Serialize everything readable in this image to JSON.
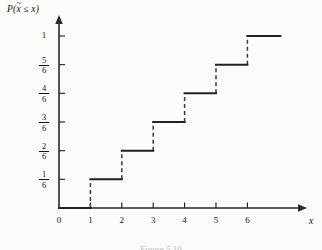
{
  "figure": {
    "y_axis_title": "P(",
    "y_axis_title_var": "x",
    "y_axis_title_rest": " ≤ x)",
    "x_axis_title": "x",
    "caption": "Figure 5.10"
  },
  "chart_data": {
    "type": "line",
    "subtype": "step-cdf",
    "title": "",
    "xlabel": "x",
    "ylabel": "P(x̃ ≤ x)",
    "xlim": [
      0,
      7.2
    ],
    "ylim": [
      0,
      1.08
    ],
    "grid": false,
    "legend": null,
    "x_ticks": [
      {
        "value": 0,
        "label": "0"
      },
      {
        "value": 1,
        "label": "1"
      },
      {
        "value": 2,
        "label": "2"
      },
      {
        "value": 3,
        "label": "3"
      },
      {
        "value": 4,
        "label": "4"
      },
      {
        "value": 5,
        "label": "5"
      },
      {
        "value": 6,
        "label": "6"
      }
    ],
    "y_ticks": [
      {
        "value": 0.166667,
        "label": "1/6",
        "numerator": "1",
        "denominator": "6"
      },
      {
        "value": 0.333333,
        "label": "2/6",
        "numerator": "2",
        "denominator": "6"
      },
      {
        "value": 0.5,
        "label": "3/6",
        "numerator": "3",
        "denominator": "6"
      },
      {
        "value": 0.666667,
        "label": "4/6",
        "numerator": "4",
        "denominator": "6"
      },
      {
        "value": 0.833333,
        "label": "5/6",
        "numerator": "5",
        "denominator": "6"
      },
      {
        "value": 1.0,
        "label": "1",
        "numerator": "1",
        "denominator": ""
      }
    ],
    "steps": [
      {
        "x_start": 0,
        "x_end": 1,
        "y": 0.0
      },
      {
        "x_start": 1,
        "x_end": 2,
        "y": 0.166667
      },
      {
        "x_start": 2,
        "x_end": 3,
        "y": 0.333333
      },
      {
        "x_start": 3,
        "x_end": 4,
        "y": 0.5
      },
      {
        "x_start": 4,
        "x_end": 5,
        "y": 0.666667
      },
      {
        "x_start": 5,
        "x_end": 6,
        "y": 0.833333
      },
      {
        "x_start": 6,
        "x_end": 7.05,
        "y": 1.0
      }
    ],
    "risers": [
      {
        "x": 1,
        "y_from": 0.0,
        "y_to": 0.166667
      },
      {
        "x": 2,
        "y_from": 0.166667,
        "y_to": 0.333333
      },
      {
        "x": 3,
        "y_from": 0.333333,
        "y_to": 0.5
      },
      {
        "x": 4,
        "y_from": 0.5,
        "y_to": 0.666667
      },
      {
        "x": 5,
        "y_from": 0.666667,
        "y_to": 0.833333
      },
      {
        "x": 6,
        "y_from": 0.833333,
        "y_to": 1.0
      }
    ]
  }
}
